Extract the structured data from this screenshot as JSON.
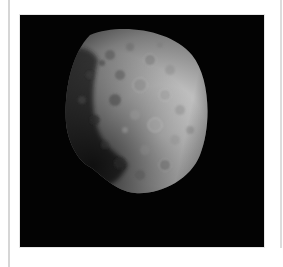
{
  "figure": {
    "background_color": "#030303",
    "page_color": "#ffffff",
    "rule_color": "#d6d6d6",
    "surface_colors": {
      "bright": "#d8d8d8",
      "mid": "#9a9a9a",
      "dark": "#2a2a2a"
    }
  }
}
